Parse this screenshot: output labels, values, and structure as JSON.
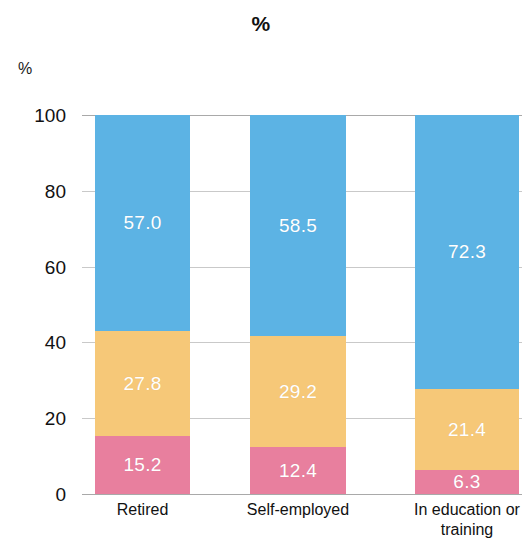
{
  "chart_data": {
    "type": "bar",
    "subtype": "stacked-bar-100",
    "title": "%",
    "subtitle": "",
    "xlabel": "",
    "ylabel": "%",
    "ylim": [
      0,
      100
    ],
    "grid": true,
    "legend_position": "none",
    "categories": [
      "Retired",
      "Self-employed",
      "In education or training"
    ],
    "category_lines": [
      [
        "Retired"
      ],
      [
        "Self-employed"
      ],
      [
        "In education or",
        "training"
      ]
    ],
    "ytick_labels": [
      "100",
      "80",
      "60",
      "40",
      "20",
      "0"
    ],
    "ytick_values": [
      100,
      80,
      60,
      40,
      20,
      0
    ],
    "series": [
      {
        "name": "bottom-segment",
        "color": "#e87f9e",
        "values": [
          15.2,
          12.4,
          6.3
        ],
        "labels": [
          "15.2",
          "12.4",
          "6.3"
        ]
      },
      {
        "name": "middle-segment",
        "color": "#f6c878",
        "values": [
          27.8,
          29.2,
          21.4
        ],
        "labels": [
          "27.8",
          "29.2",
          "21.4"
        ]
      },
      {
        "name": "top-segment",
        "color": "#5cb3e4",
        "values": [
          57.0,
          58.5,
          72.3
        ],
        "labels": [
          "57.0",
          "58.5",
          "72.3"
        ]
      }
    ],
    "colors": {
      "blue": "#5cb3e4",
      "orange": "#f6c878",
      "pink": "#e87f9e",
      "axis": "#a9a9a9",
      "text": "#111111",
      "value_text": "#ffffff"
    }
  }
}
